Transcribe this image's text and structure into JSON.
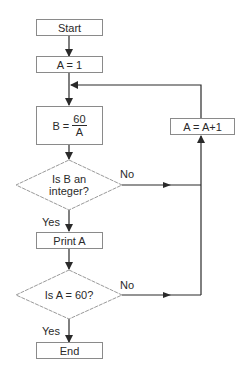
{
  "flowchart": {
    "nodes": {
      "start": {
        "label": "Start",
        "shape": "terminal"
      },
      "init": {
        "label": "A = 1",
        "shape": "process"
      },
      "compute": {
        "label_prefix": "B =",
        "numerator": "60",
        "denominator": "A",
        "shape": "process"
      },
      "increment": {
        "label": "A = A+1",
        "shape": "process"
      },
      "decision1": {
        "line1": "Is B an",
        "line2": "integer?",
        "shape": "decision"
      },
      "print": {
        "label": "Print A",
        "shape": "process"
      },
      "decision2": {
        "label": "Is A = 60?",
        "shape": "decision"
      },
      "end": {
        "label": "End",
        "shape": "terminal"
      }
    },
    "edges": {
      "d1_no": "No",
      "d1_yes": "Yes",
      "d2_no": "No",
      "d2_yes": "Yes"
    },
    "colors": {
      "box_border": "#8a8a8a",
      "line": "#2a2a2a",
      "diamond_border": "#9a9a9a"
    }
  }
}
